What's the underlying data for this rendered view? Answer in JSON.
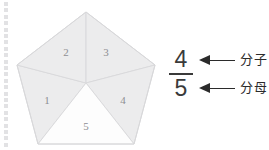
{
  "page": {
    "background_color": "#ffffff",
    "binding_dots": {
      "count": 23,
      "color": "#e2e2e4",
      "spacing": 6.4
    }
  },
  "figure": {
    "shape_name": "pentagon",
    "total_parts": 5,
    "shaded_parts": 4,
    "unshaded_parts": 1,
    "fill_color": "#ececed",
    "unshaded_fill_color": "#fdfdfd",
    "stroke_color": "#d8d8da",
    "sectors": [
      {
        "label": "1",
        "shaded": true,
        "x": 47,
        "y": 104
      },
      {
        "label": "2",
        "shaded": true,
        "x": 66,
        "y": 56
      },
      {
        "label": "3",
        "shaded": true,
        "x": 106,
        "y": 56
      },
      {
        "label": "4",
        "shaded": true,
        "x": 123,
        "y": 104
      },
      {
        "label": "5",
        "shaded": false,
        "x": 86,
        "y": 130
      }
    ],
    "vertices": [
      {
        "x": 86,
        "y": 12
      },
      {
        "x": 155,
        "y": 65
      },
      {
        "x": 134,
        "y": 144
      },
      {
        "x": 38,
        "y": 144
      },
      {
        "x": 17,
        "y": 65
      }
    ],
    "center": {
      "x": 86,
      "y": 83
    }
  },
  "fraction": {
    "numerator": "4",
    "denominator": "5",
    "bar_color": "#3a3a3a",
    "text_color": "#3a3a3a"
  },
  "callouts": [
    {
      "id": "numerator",
      "label": "分子",
      "arrow_direction": "left",
      "arrow_color": "#2b2b2b"
    },
    {
      "id": "denominator",
      "label": "分母",
      "arrow_direction": "left",
      "arrow_color": "#2b2b2b"
    }
  ]
}
